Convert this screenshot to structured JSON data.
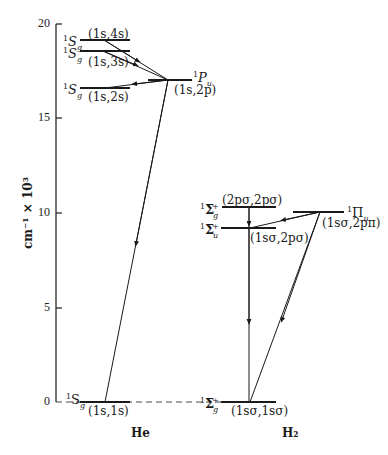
{
  "figure": {
    "type": "energy-level-diagram",
    "y_axis": {
      "label": "cm⁻¹ × 10³",
      "ticks": [
        "0",
        "5",
        "10",
        "15",
        "20"
      ],
      "range": [
        0,
        20
      ]
    },
    "systems": [
      {
        "name": "He",
        "levels": [
          {
            "term": "¹S_g",
            "config": "(1s,4s)",
            "energy": 19.2
          },
          {
            "term": "¹S_g",
            "config": "(1s,3s)",
            "energy": 18.6
          },
          {
            "term": "¹P_u",
            "config": "(1s,2p)",
            "energy": 17.0
          },
          {
            "term": "¹S_g",
            "config": "(1s,2s)",
            "energy": 16.6
          },
          {
            "term": "¹S_g",
            "config": "(1s,1s)",
            "energy": 0
          }
        ],
        "transitions": [
          {
            "from": "(1s,4s)",
            "to": "(1s,2p)"
          },
          {
            "from": "(1s,3s)",
            "to": "(1s,2p)"
          },
          {
            "from": "(1s,2p)",
            "to": "(1s,2s)"
          },
          {
            "from": "(1s,2p)",
            "to": "(1s,1s)"
          }
        ]
      },
      {
        "name": "H₂",
        "levels": [
          {
            "term": "¹Σ⁺_g",
            "config": "(2pσ,2pσ)",
            "energy": 10.3
          },
          {
            "term": "¹Σ⁺_u",
            "config": "(1sσ,2pσ)",
            "energy": 9.2
          },
          {
            "term": "¹Π_u",
            "config": "(1sσ,2pπ)",
            "energy": 10.1
          },
          {
            "term": "¹Σ⁺_g",
            "config": "(1sσ,1sσ)",
            "energy": 0
          }
        ],
        "transitions": [
          {
            "from": "(2pσ,2pσ)",
            "to": "(1sσ,2pσ)"
          },
          {
            "from": "(1sσ,2pσ)",
            "to": "(1sσ,1sσ)"
          },
          {
            "from": "(1sσ,2pπ)",
            "to": "(1sσ,2pσ)"
          },
          {
            "from": "(1sσ,2pπ)",
            "to": "(1sσ,1sσ)"
          }
        ]
      }
    ]
  },
  "labels": {
    "ylabel": "cm⁻¹ × 10³",
    "tick0": "0",
    "tick5": "5",
    "tick10": "10",
    "tick15": "15",
    "tick20": "20",
    "he": "He",
    "h2": "H₂",
    "he_4s": "(1s,4s)",
    "he_3s": "(1s,3s)",
    "he_2s": "(1s,2s)",
    "he_2p": "(1s,2p)",
    "he_1s": "(1s,1s)",
    "h2_2psig2psig": "(2pσ,2pσ)",
    "h2_1ssig2psig": "(1sσ,2pσ)",
    "h2_1ssig2ppi": "(1sσ,2pπ)",
    "h2_1ssig1ssig": "(1sσ,1sσ)"
  }
}
